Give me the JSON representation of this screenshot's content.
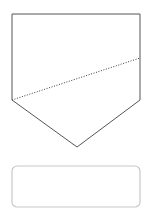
{
  "canvas": {
    "width": 152,
    "height": 215,
    "background_color": "#ffffff",
    "title": "Pentagon with dashed chord and rounded rectangle"
  },
  "shapes": {
    "pentagon": {
      "name": "pentagon-outline",
      "description": "Inverted home-plate pentagon",
      "points": "12,14 140,14 140,100 77,147 12,100",
      "stroke_color": "#555555",
      "stroke_width": 1,
      "fill_color": "#ffffff"
    },
    "dashed_chord": {
      "name": "dashed-chord-line",
      "description": "Dotted diagonal line from lower-left vertex to right edge",
      "x1": 12,
      "y1": 100,
      "x2": 140,
      "y2": 58,
      "stroke_color": "#3b3b3b",
      "stroke_width": 1,
      "dash_pattern": "1 1.6"
    },
    "rounded_rectangle": {
      "name": "rounded-rectangle-outline",
      "description": "Rounded rectangle below the pentagon",
      "x": 12,
      "y": 166,
      "width": 128,
      "height": 41,
      "corner_radius": 5,
      "stroke_color": "#c8c8c8",
      "stroke_width": 1.2,
      "fill_color": "#ffffff"
    }
  }
}
